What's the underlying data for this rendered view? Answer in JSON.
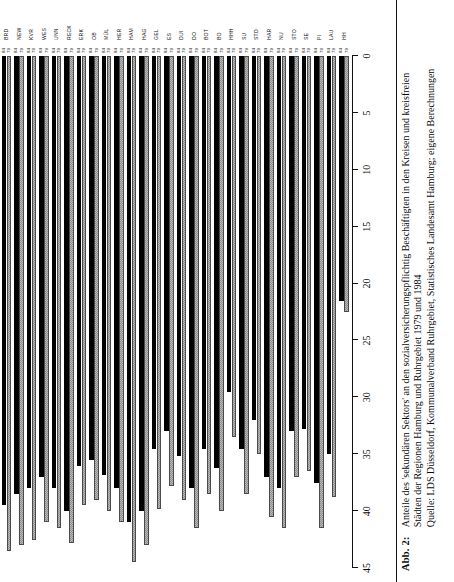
{
  "figure": {
    "number_label": "Abb.  2:",
    "caption_lines": [
      "Anteile des 'sekundären Sektors' an den sozialversicherungspflichtig Beschäftigten in den Kreisen und kreisfreien",
      "Städten der Regionen Hamburg und Ruhrgebiet 1979 und 1984",
      "Quelle: LDS Düsseldorf, Kommunalverband Ruhrgebiet, Statistisches Landesamt Hamburg; eigene Berechnungen"
    ]
  },
  "chart_data": {
    "type": "bar",
    "orientation": "horizontal",
    "title": "Anteile des 'sekundären Sektors' an den sozialversicherungspflichtig Beschäftigten in den Kreisen und kreisfreien Städten der Regionen Hamburg und Ruhrgebiet 1979 und 1984",
    "xlabel": "",
    "ylabel": "",
    "xlim": [
      0,
      45
    ],
    "grid": false,
    "legend": "none",
    "value_axis_reversed": true,
    "axis_ticks": [
      45,
      40,
      35,
      30,
      25,
      20,
      15,
      10,
      5,
      0
    ],
    "series_labels": [
      "79",
      "84"
    ],
    "series_colors": {
      "79": "#b9b9b9",
      "84": "#000000"
    },
    "categories": [
      "BRD",
      "NEW",
      "KVR",
      "WES",
      "UNN",
      "RECK",
      "ERK",
      "OB",
      "MÜL",
      "HER",
      "HAM",
      "HAG",
      "GEL",
      "ES",
      "DUI",
      "DO",
      "BOT",
      "BO",
      "HHH",
      "SU",
      "STD",
      "HAR",
      "NU",
      "STO",
      "SE",
      "PI",
      "LAU",
      "HH"
    ],
    "series": [
      {
        "name": "79",
        "values": [
          43.5,
          43.0,
          42.5,
          41.0,
          41.5,
          42.8,
          39.5,
          39.0,
          40.0,
          41.0,
          44.5,
          43.0,
          39.8,
          37.8,
          39.0,
          41.5,
          38.5,
          40.0,
          33.5,
          38.5,
          35.0,
          40.5,
          41.5,
          37.0,
          36.5,
          41.5,
          38.8,
          22.5
        ]
      },
      {
        "name": "84",
        "values": [
          39.5,
          38.5,
          38.0,
          37.0,
          38.0,
          40.0,
          36.0,
          35.5,
          36.8,
          38.0,
          41.0,
          40.0,
          34.5,
          33.0,
          35.2,
          38.0,
          34.5,
          36.2,
          29.5,
          34.5,
          32.0,
          37.0,
          38.0,
          33.0,
          32.8,
          37.5,
          35.0,
          21.5
        ]
      }
    ]
  }
}
